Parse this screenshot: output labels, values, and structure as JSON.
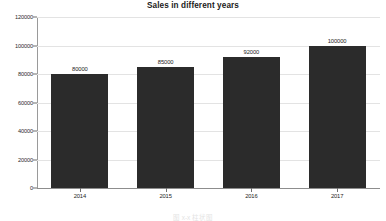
{
  "chart_data": {
    "type": "bar",
    "title": "Sales in different years",
    "xlabel": "",
    "ylabel": "",
    "categories": [
      "2014",
      "2015",
      "2016",
      "2017"
    ],
    "values": [
      80000,
      85000,
      92000,
      100000
    ],
    "data_labels": [
      "80000",
      "85000",
      "92000",
      "100000"
    ],
    "ylim": [
      0,
      120000
    ],
    "yticks": [
      0,
      20000,
      40000,
      60000,
      80000,
      100000,
      120000
    ],
    "ytick_labels": [
      "0",
      "20000",
      "40000",
      "60000",
      "80000",
      "100000",
      "120000"
    ],
    "grid": true,
    "legend": false,
    "bar_color": "#2b2b2b",
    "grid_color": "#e3e3e3",
    "axis_color": "#8d8d8d",
    "background_color": "#ffffff"
  },
  "caption": {
    "text": "图 x-x  柱状图"
  }
}
